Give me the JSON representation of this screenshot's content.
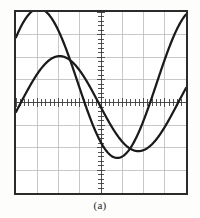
{
  "figure": {
    "caption": "(a)",
    "kind": "oscilloscope-display"
  },
  "screen": {
    "width_px": 174,
    "height_px": 185,
    "border_color": "#2b2b2b",
    "background_color": "#ffffff"
  },
  "graticule": {
    "columns": 8,
    "rows": 8,
    "grid_color": "#b9b9b9",
    "center_axis_color": "#4a4a4a",
    "minor_ticks_per_division": 5,
    "horizontal_center_row": 4,
    "vertical_center_column": 4
  },
  "traces": {
    "color": "#1a1a1a",
    "stroke_width": 2.3,
    "channels": [
      {
        "name": "channel-1",
        "label": "CH1",
        "amplitude_divisions": 3.3,
        "vertical_offset_divisions": 0.85,
        "period_divisions": 7.4,
        "phase_degrees": 38,
        "cycles_shown": 1.08
      },
      {
        "name": "channel-2",
        "label": "CH2",
        "amplitude_divisions": 2.1,
        "vertical_offset_divisions": -0.05,
        "period_divisions": 7.4,
        "phase_degrees": -10,
        "cycles_shown": 1.08
      }
    ]
  },
  "chart_data": {
    "type": "line",
    "title": "",
    "subtitle": "",
    "xlabel": "",
    "ylabel": "",
    "xlim": [
      0,
      8
    ],
    "ylim": [
      -4,
      4
    ],
    "grid": true,
    "legend": "none",
    "axis_units": {
      "x": "divisions",
      "y": "divisions"
    },
    "annotations": [
      "(a)"
    ],
    "series": [
      {
        "name": "channel-1",
        "form": "sine",
        "amplitude": 3.3,
        "offset": 0.85,
        "period": 7.4,
        "phase_deg": 38,
        "peak_point": [
          2.95,
          4.0
        ],
        "trough_point": [
          6.85,
          -0.05
        ],
        "zero_crossing_rising_x": 0.2,
        "zero_crossing_falling_x": 4.95
      },
      {
        "name": "channel-2",
        "form": "sine",
        "amplitude": 2.1,
        "offset": -0.05,
        "period": 7.4,
        "phase_deg": -10,
        "peak_point": [
          2.1,
          2.05
        ],
        "trough_point": [
          6.0,
          -2.15
        ],
        "zero_crossing_rising_x": 0.25,
        "zero_crossing_falling_x": 4.05
      }
    ]
  }
}
